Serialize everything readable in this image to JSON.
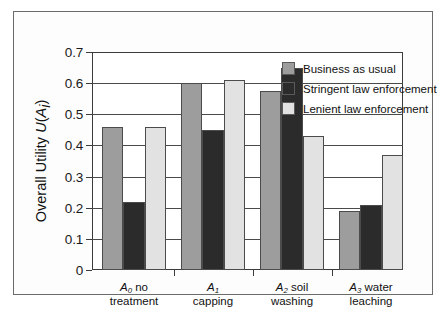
{
  "chart_data": {
    "type": "bar",
    "title": "",
    "xlabel": "",
    "ylabel": "Overall Utility U(Ai)",
    "ylim": [
      0,
      0.7
    ],
    "ytick_values": [
      0,
      0.1,
      0.2,
      0.3,
      0.4,
      0.5,
      0.6,
      0.7
    ],
    "ytick_labels": [
      "0",
      "0.1",
      "0.2",
      "0.3",
      "0.4",
      "0.5",
      "0.6",
      "0.7"
    ],
    "grid": "horizontal",
    "legend_position": "inside-top-right",
    "categories": [
      "A0 no treatment",
      "A1 capping",
      "A2 soil washing",
      "A3 water leaching"
    ],
    "category_lines": [
      [
        "A",
        "0",
        " no",
        "treatment"
      ],
      [
        "A",
        "1",
        "",
        "capping"
      ],
      [
        "A",
        "2",
        " soil",
        "washing"
      ],
      [
        "A",
        "3",
        " water",
        "leaching"
      ]
    ],
    "series": [
      {
        "name": "Business as usual",
        "color": "#9d9d9d",
        "values": [
          0.46,
          0.6,
          0.575,
          0.19
        ]
      },
      {
        "name": "Stringent law enforcement",
        "color": "#2b2b2b",
        "values": [
          0.22,
          0.45,
          0.65,
          0.21
        ]
      },
      {
        "name": "Lenient law enforcement",
        "color": "#e2e2e2",
        "values": [
          0.46,
          0.61,
          0.43,
          0.37
        ]
      }
    ]
  },
  "axis": {
    "y_title_prefix": "Overall Utility ",
    "y_title_u": "U",
    "y_title_open": "(",
    "y_title_a": "A",
    "y_title_sub": "i",
    "y_title_close": ")"
  },
  "legend": {
    "items": [
      {
        "label": "Business as usual",
        "swatch": "#9d9d9d"
      },
      {
        "label": "Stringent law enforcement",
        "swatch": "#2b2b2b"
      },
      {
        "label": "Lenient law enforcement",
        "swatch": "#e2e2e2"
      }
    ]
  }
}
